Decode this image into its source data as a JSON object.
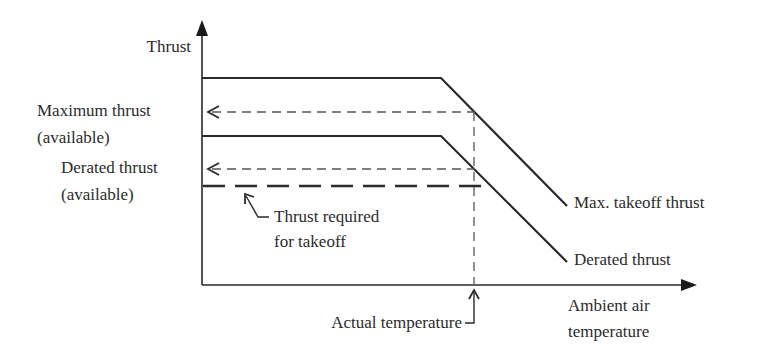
{
  "diagram": {
    "y_axis_label": "Thrust",
    "x_axis_label_line1": "Ambient air",
    "x_axis_label_line2": "temperature",
    "left_labels": {
      "max_line1": "Maximum thrust",
      "max_line2": "(available)",
      "derated_line1": "Derated thrust",
      "derated_line2": "(available)"
    },
    "curve_labels": {
      "max_takeoff": "Max. takeoff thrust",
      "derated": "Derated thrust"
    },
    "annotations": {
      "required_line1": "Thrust required",
      "required_line2": "for takeoff",
      "actual_temperature": "Actual temperature"
    },
    "colors": {
      "line": "#2a2a2a",
      "dashed": "#555555",
      "background": "#ffffff"
    }
  }
}
